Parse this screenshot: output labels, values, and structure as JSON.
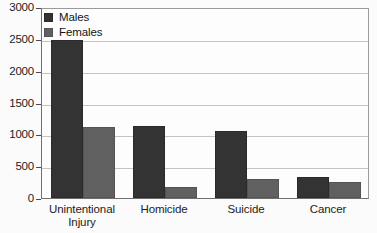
{
  "chart_data": {
    "type": "bar",
    "title": "",
    "xlabel": "",
    "ylabel": "",
    "ylim": [
      0,
      3000
    ],
    "ytick_labels": [
      "3000",
      "2500",
      "2000",
      "1500",
      "1000",
      "500",
      "0"
    ],
    "ytick_values": [
      3000,
      2500,
      2000,
      1500,
      1000,
      500,
      0
    ],
    "grid": true,
    "legend_position": "top-left",
    "categories": [
      "Unintentional Injury",
      "Homicide",
      "Suicide",
      "Cancer"
    ],
    "category_lines": [
      [
        "Unintentional",
        "Injury"
      ],
      [
        "Homicide"
      ],
      [
        "Suicide"
      ],
      [
        "Cancer"
      ]
    ],
    "series": [
      {
        "name": "Males",
        "color": "#333333",
        "values": [
          2480,
          1130,
          1055,
          330
        ]
      },
      {
        "name": "Females",
        "color": "#606060",
        "values": [
          1120,
          175,
          300,
          250
        ]
      }
    ]
  },
  "legend": {
    "items": [
      {
        "label": "Males"
      },
      {
        "label": "Females"
      }
    ]
  },
  "colors": {
    "males": "#333333",
    "females": "#606060",
    "gridline": "#c3c3c3",
    "axis": "#6f6f6f",
    "background": "#fdfdfd",
    "text": "#1b1b1b"
  }
}
